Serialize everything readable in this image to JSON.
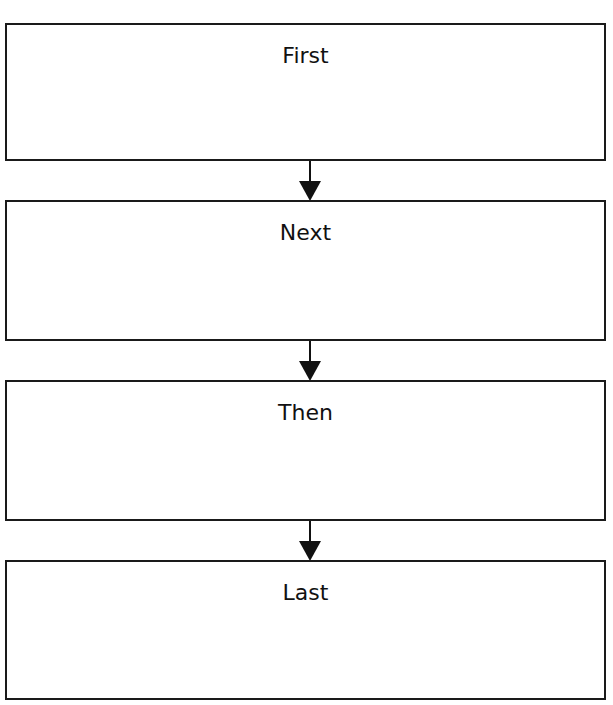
{
  "flowchart": {
    "steps": [
      {
        "label": "First"
      },
      {
        "label": "Next"
      },
      {
        "label": "Then"
      },
      {
        "label": "Last"
      }
    ],
    "colors": {
      "stroke": "#111111",
      "background": "#ffffff"
    }
  }
}
